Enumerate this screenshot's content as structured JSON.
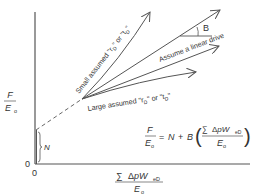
{
  "diagram": {
    "y_axis_label": {
      "numerator": "F",
      "denominator": "E",
      "denominator_sub": "o"
    },
    "x_axis_label": {
      "numerator_sum": "∑",
      "numerator": "ΔpW",
      "numerator_sub": "eD",
      "denominator": "E",
      "denominator_sub": "o"
    },
    "origin_x": "0",
    "origin_y": "0",
    "intercept_label": "N",
    "angle_label": "B",
    "lines": [
      {
        "label": "Small assumed \"r₀\" or \"t₀\"",
        "label_display_a": "Small assumed \"r",
        "label_display_sub": "D",
        "label_display_b": "\" or \"t",
        "type": "curve-upward"
      },
      {
        "label": "Assume a linear drive",
        "type": "linear"
      },
      {
        "label": "Large assumed \"r₀\" or \"t₀\"",
        "label_display_a": "Large assumed \"r",
        "label_display_b": "\" or \"t",
        "type": "curve-downward"
      }
    ],
    "equation": {
      "lhs_num": "F",
      "lhs_den": "E",
      "lhs_den_sub": "o",
      "equals": "=",
      "N": "N",
      "plus": "+",
      "B": "B",
      "inner_sum": "∑",
      "inner_num": "ΔpW",
      "inner_num_sub": "eD",
      "inner_den": "E",
      "inner_den_sub": "o"
    },
    "colors": {
      "line": "#555555",
      "text": "#333333",
      "background": "#ffffff"
    }
  }
}
